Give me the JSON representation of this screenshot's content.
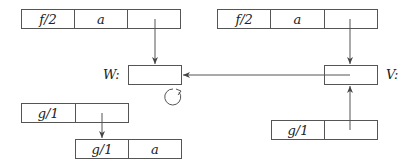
{
  "diagram": {
    "records": [
      {
        "id": "top-left-record",
        "cells": [
          "f/2",
          "a",
          ""
        ]
      },
      {
        "id": "top-right-record",
        "cells": [
          "f/2",
          "a",
          ""
        ]
      },
      {
        "id": "w-node",
        "label": "W:",
        "cells": [
          ""
        ]
      },
      {
        "id": "v-node",
        "label": "V:",
        "cells": [
          ""
        ]
      },
      {
        "id": "mid-left-record",
        "cells": [
          "g/1",
          ""
        ]
      },
      {
        "id": "bottom-left-record",
        "cells": [
          "g/1",
          "a"
        ]
      },
      {
        "id": "bottom-right-record",
        "cells": [
          "g/1",
          ""
        ]
      }
    ],
    "edges": [
      {
        "from": "top-left-record.cell3",
        "to": "w-node"
      },
      {
        "from": "top-right-record.cell3",
        "to": "v-node"
      },
      {
        "from": "v-node",
        "to": "w-node"
      },
      {
        "from": "bottom-right-record.cell2",
        "to": "v-node"
      },
      {
        "from": "mid-left-record.cell2",
        "to": "bottom-left-record"
      },
      {
        "from": "w-node",
        "to": "w-node",
        "type": "self-loop"
      }
    ]
  }
}
